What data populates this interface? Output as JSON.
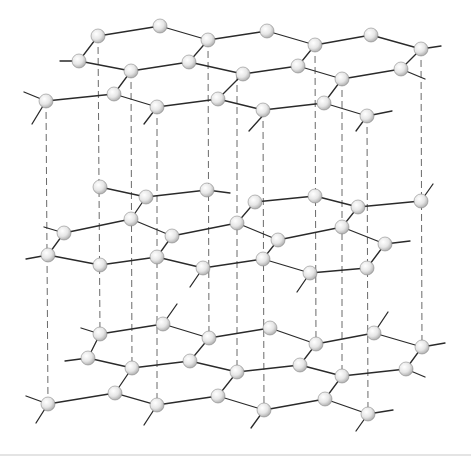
{
  "diagram": {
    "title": "Graphite layered hexagonal crystal structure",
    "colors": {
      "background": "#ffffff",
      "bond": "#2a2a2a",
      "interlayer_dash": "#6a6a6a",
      "atom_fill_light": "#ffffff",
      "atom_fill_dark": "#a8a8a8",
      "atom_stroke": "#8c8c8c"
    },
    "atom_radius": 7,
    "layers": [
      {
        "name": "top-layer",
        "atoms": [
          [
            98,
            36
          ],
          [
            160,
            26
          ],
          [
            208,
            40
          ],
          [
            267,
            31
          ],
          [
            315,
            45
          ],
          [
            371,
            35
          ],
          [
            421,
            49
          ],
          [
            79,
            61
          ],
          [
            131,
            71
          ],
          [
            189,
            62
          ],
          [
            243,
            74
          ],
          [
            298,
            66
          ],
          [
            342,
            79
          ],
          [
            401,
            69
          ],
          [
            46,
            101
          ],
          [
            114,
            94
          ],
          [
            157,
            107
          ],
          [
            218,
            99
          ],
          [
            263,
            110
          ],
          [
            324,
            103
          ],
          [
            367,
            116
          ]
        ],
        "bonds": [
          [
            0,
            1
          ],
          [
            1,
            2
          ],
          [
            2,
            3
          ],
          [
            3,
            4
          ],
          [
            4,
            5
          ],
          [
            5,
            6
          ],
          [
            7,
            8
          ],
          [
            8,
            9
          ],
          [
            9,
            10
          ],
          [
            10,
            11
          ],
          [
            11,
            12
          ],
          [
            12,
            13
          ],
          [
            14,
            15
          ],
          [
            15,
            16
          ],
          [
            16,
            17
          ],
          [
            17,
            18
          ],
          [
            18,
            19
          ],
          [
            19,
            20
          ],
          [
            0,
            7
          ],
          [
            2,
            9
          ],
          [
            4,
            11
          ],
          [
            6,
            13
          ],
          [
            8,
            15
          ],
          [
            10,
            17
          ],
          [
            12,
            19
          ]
        ],
        "stubs": [
          [
            [
              79,
              61
            ],
            [
              60,
              61
            ]
          ],
          [
            [
              401,
              69
            ],
            [
              425,
              79
            ]
          ],
          [
            [
              421,
              49
            ],
            [
              441,
              46
            ]
          ],
          [
            [
              46,
              101
            ],
            [
              24,
              92
            ]
          ],
          [
            [
              46,
              101
            ],
            [
              32,
              124
            ]
          ],
          [
            [
              157,
              107
            ],
            [
              144,
              124
            ]
          ],
          [
            [
              367,
              116
            ],
            [
              392,
              111
            ]
          ],
          [
            [
              367,
              116
            ],
            [
              356,
              131
            ]
          ],
          [
            [
              267,
              111
            ],
            [
              249,
              131
            ]
          ]
        ]
      },
      {
        "name": "middle-layer",
        "atoms": [
          [
            100,
            187
          ],
          [
            146,
            197
          ],
          [
            207,
            190
          ],
          [
            255,
            202
          ],
          [
            315,
            196
          ],
          [
            358,
            207
          ],
          [
            421,
            201
          ],
          [
            64,
            233
          ],
          [
            131,
            219
          ],
          [
            172,
            236
          ],
          [
            237,
            223
          ],
          [
            278,
            240
          ],
          [
            342,
            227
          ],
          [
            385,
            244
          ],
          [
            48,
            255
          ],
          [
            100,
            265
          ],
          [
            157,
            257
          ],
          [
            203,
            268
          ],
          [
            263,
            259
          ],
          [
            310,
            273
          ],
          [
            367,
            268
          ]
        ],
        "bonds": [
          [
            0,
            1
          ],
          [
            1,
            2
          ],
          [
            3,
            4
          ],
          [
            4,
            5
          ],
          [
            5,
            6
          ],
          [
            7,
            8
          ],
          [
            8,
            9
          ],
          [
            9,
            10
          ],
          [
            10,
            11
          ],
          [
            11,
            12
          ],
          [
            12,
            13
          ],
          [
            14,
            15
          ],
          [
            15,
            16
          ],
          [
            16,
            17
          ],
          [
            17,
            18
          ],
          [
            18,
            19
          ],
          [
            19,
            20
          ],
          [
            1,
            8
          ],
          [
            3,
            10
          ],
          [
            5,
            12
          ],
          [
            7,
            14
          ],
          [
            9,
            16
          ],
          [
            11,
            18
          ],
          [
            13,
            20
          ]
        ],
        "stubs": [
          [
            [
              64,
              233
            ],
            [
              44,
              227
            ]
          ],
          [
            [
              48,
              255
            ],
            [
              26,
              259
            ]
          ],
          [
            [
              203,
              268
            ],
            [
              190,
              287
            ]
          ],
          [
            [
              385,
              244
            ],
            [
              410,
              241
            ]
          ],
          [
            [
              421,
              201
            ],
            [
              433,
              184
            ]
          ],
          [
            [
              310,
              273
            ],
            [
              297,
              292
            ]
          ],
          [
            [
              207,
              190
            ],
            [
              230,
              193
            ]
          ]
        ]
      },
      {
        "name": "bottom-layer",
        "atoms": [
          [
            100,
            334
          ],
          [
            163,
            324
          ],
          [
            209,
            338
          ],
          [
            270,
            328
          ],
          [
            316,
            344
          ],
          [
            374,
            333
          ],
          [
            422,
            347
          ],
          [
            88,
            358
          ],
          [
            132,
            368
          ],
          [
            190,
            361
          ],
          [
            237,
            372
          ],
          [
            300,
            365
          ],
          [
            342,
            376
          ],
          [
            406,
            369
          ],
          [
            48,
            404
          ],
          [
            115,
            393
          ],
          [
            157,
            405
          ],
          [
            218,
            396
          ],
          [
            264,
            410
          ],
          [
            325,
            399
          ],
          [
            368,
            414
          ]
        ],
        "bonds": [
          [
            0,
            1
          ],
          [
            1,
            2
          ],
          [
            2,
            3
          ],
          [
            3,
            4
          ],
          [
            4,
            5
          ],
          [
            5,
            6
          ],
          [
            7,
            8
          ],
          [
            8,
            9
          ],
          [
            9,
            10
          ],
          [
            10,
            11
          ],
          [
            11,
            12
          ],
          [
            12,
            13
          ],
          [
            14,
            15
          ],
          [
            15,
            16
          ],
          [
            16,
            17
          ],
          [
            17,
            18
          ],
          [
            18,
            19
          ],
          [
            19,
            20
          ],
          [
            0,
            7
          ],
          [
            2,
            9
          ],
          [
            4,
            11
          ],
          [
            6,
            13
          ],
          [
            8,
            15
          ],
          [
            10,
            17
          ],
          [
            12,
            19
          ]
        ],
        "stubs": [
          [
            [
              100,
              334
            ],
            [
              81,
              328
            ]
          ],
          [
            [
              88,
              358
            ],
            [
              65,
              361
            ]
          ],
          [
            [
              163,
              324
            ],
            [
              177,
              304
            ]
          ],
          [
            [
              374,
              333
            ],
            [
              388,
              312
            ]
          ],
          [
            [
              422,
              347
            ],
            [
              445,
              343
            ]
          ],
          [
            [
              406,
              369
            ],
            [
              425,
              377
            ]
          ],
          [
            [
              48,
              404
            ],
            [
              26,
              396
            ]
          ],
          [
            [
              48,
              404
            ],
            [
              36,
              423
            ]
          ],
          [
            [
              157,
              405
            ],
            [
              144,
              425
            ]
          ],
          [
            [
              264,
              410
            ],
            [
              251,
              428
            ]
          ],
          [
            [
              368,
              414
            ],
            [
              393,
              410
            ]
          ],
          [
            [
              368,
              414
            ],
            [
              356,
              431
            ]
          ]
        ]
      }
    ],
    "interlayer_lines": [
      [
        46,
        101,
        48,
        404
      ],
      [
        98,
        36,
        100,
        334
      ],
      [
        131,
        71,
        132,
        368
      ],
      [
        157,
        107,
        157,
        405
      ],
      [
        208,
        40,
        209,
        338
      ],
      [
        237,
        74,
        237,
        372
      ],
      [
        263,
        110,
        264,
        410
      ],
      [
        315,
        45,
        316,
        344
      ],
      [
        342,
        79,
        342,
        376
      ],
      [
        367,
        116,
        368,
        414
      ],
      [
        421,
        49,
        422,
        347
      ]
    ],
    "baseline": [
      0,
      455,
      471,
      455
    ]
  }
}
